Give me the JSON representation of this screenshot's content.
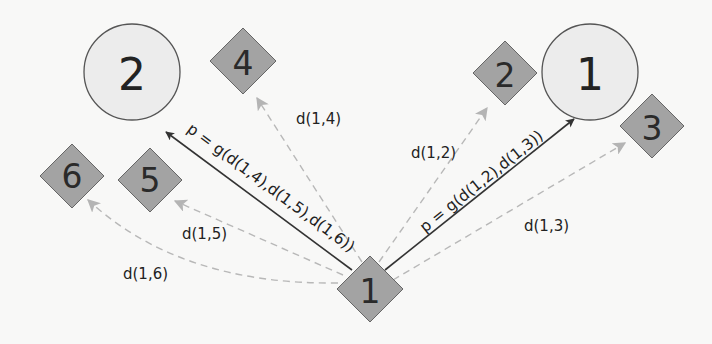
{
  "colors": {
    "background": "#f8f8f7",
    "circle_fill": "#ececec",
    "circle_stroke": "#555555",
    "diamond_fill": "#a3a3a3",
    "diamond_stroke": "#666666",
    "dashed_edge": "#b8b8b8",
    "solid_edge": "#333333",
    "text": "#222222"
  },
  "circles": [
    {
      "id": "circle-2",
      "label": "2",
      "cx": 132,
      "cy": 72,
      "r": 48
    },
    {
      "id": "circle-1",
      "label": "1",
      "cx": 590,
      "cy": 72,
      "r": 48
    }
  ],
  "diamonds": [
    {
      "id": "diamond-4",
      "label": "4",
      "cx": 243,
      "cy": 61,
      "h": 33
    },
    {
      "id": "diamond-2",
      "label": "2",
      "cx": 505,
      "cy": 73,
      "h": 32
    },
    {
      "id": "diamond-3",
      "label": "3",
      "cx": 652,
      "cy": 126,
      "h": 32
    },
    {
      "id": "diamond-6",
      "label": "6",
      "cx": 72,
      "cy": 176,
      "h": 32
    },
    {
      "id": "diamond-5",
      "label": "5",
      "cx": 150,
      "cy": 180,
      "h": 32
    },
    {
      "id": "diamond-1",
      "label": "1",
      "cx": 370,
      "cy": 289,
      "h": 33
    }
  ],
  "distance_edges": [
    {
      "label": "d(1,4)",
      "from": "diamond-1",
      "to": "diamond-4"
    },
    {
      "label": "d(1,2)",
      "from": "diamond-1",
      "to": "diamond-2"
    },
    {
      "label": "d(1,3)",
      "from": "diamond-1",
      "to": "diamond-3"
    },
    {
      "label": "d(1,5)",
      "from": "diamond-1",
      "to": "diamond-5"
    },
    {
      "label": "d(1,6)",
      "from": "diamond-1",
      "to": "diamond-6"
    }
  ],
  "assignment_edges": [
    {
      "label": "p = g(d(1,4),d(1,5),d(1,6))",
      "from": "diamond-1",
      "to": "circle-2"
    },
    {
      "label": "p = g(d(1,2),d(1,3))",
      "from": "diamond-1",
      "to": "circle-1"
    }
  ]
}
